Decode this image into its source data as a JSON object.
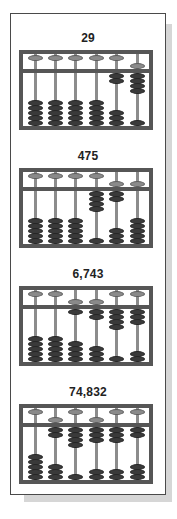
{
  "diagram": {
    "type": "abacus-illustration",
    "colors": {
      "frame": "#565656",
      "rod": "#8c8c8c",
      "heaven_bead": "#8a8a8a",
      "earth_bead": "#3a3a3a",
      "panel_border": "#4a4a4a",
      "shadow": "#d6d6d6"
    },
    "abacuses": [
      {
        "label": "29",
        "digits": [
          0,
          0,
          0,
          0,
          2,
          9
        ]
      },
      {
        "label": "475",
        "digits": [
          0,
          0,
          0,
          4,
          7,
          5
        ]
      },
      {
        "label": "6,743",
        "digits": [
          0,
          0,
          6,
          7,
          4,
          3
        ]
      },
      {
        "label": "74,832",
        "digits": [
          0,
          7,
          4,
          8,
          3,
          2
        ]
      }
    ]
  }
}
